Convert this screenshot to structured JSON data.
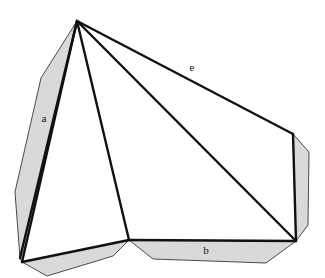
{
  "figure": {
    "title": "",
    "kind": "line-drawing",
    "canvas": {
      "width": 325,
      "height": 278,
      "background": "#ffffff"
    },
    "colors": {
      "stroke": "#111111",
      "shade_fill": "#d9d9d9",
      "shade_stroke": "#4a4a4a",
      "label_text": "#111111",
      "background": "#ffffff"
    },
    "stroke_widths": {
      "main_edge": 2.4,
      "thin_edge": 1.0
    },
    "vertices": {
      "apex": {
        "x": 77,
        "y": 21
      },
      "bottom_left": {
        "x": 22,
        "y": 262
      },
      "bottom_mid": {
        "x": 129,
        "y": 240
      },
      "bottom_right": {
        "x": 296,
        "y": 241
      },
      "top_right": {
        "x": 293,
        "y": 134
      },
      "left_shade_outer_top": {
        "x": 41,
        "y": 78
      },
      "left_shade_outer_bend": {
        "x": 15,
        "y": 192
      },
      "left_shade_outer_bottom": {
        "x": 20,
        "y": 258
      },
      "bottom_shade_left": {
        "x": 47,
        "y": 276
      },
      "bottom_shade_mid": {
        "x": 113,
        "y": 256
      },
      "bottom_shade_right_in": {
        "x": 153,
        "y": 259
      },
      "bottom_shade_right_out": {
        "x": 266,
        "y": 263
      },
      "right_shade_top": {
        "x": 309,
        "y": 152
      },
      "right_shade_bottom": {
        "x": 308,
        "y": 225
      }
    },
    "faces": [
      {
        "name": "left-shaded-face",
        "shaded": true
      },
      {
        "name": "bottom-shaded-face",
        "shaded": true
      },
      {
        "name": "right-shaded-face",
        "shaded": true
      }
    ],
    "edges": [
      {
        "name": "apex-to-left-shade",
        "from": "apex",
        "to": "left_shade_outer_bottom"
      },
      {
        "name": "apex-to-bottom-left",
        "from": "apex",
        "to": "bottom_left"
      },
      {
        "name": "apex-to-bottom-mid",
        "from": "apex",
        "to": "bottom_mid"
      },
      {
        "name": "apex-to-bottom-right",
        "from": "apex",
        "to": "bottom_right"
      },
      {
        "name": "apex-to-top-right",
        "from": "apex",
        "to": "top_right",
        "label": "e"
      },
      {
        "name": "bottom-left-to-bottom-mid",
        "from": "bottom_left",
        "to": "bottom_mid"
      },
      {
        "name": "bottom-mid-to-bottom-right",
        "from": "bottom_mid",
        "to": "bottom_right",
        "label": "b"
      },
      {
        "name": "top-right-to-bottom-right",
        "from": "top_right",
        "to": "bottom_right"
      }
    ],
    "labels": [
      {
        "id": "a",
        "text": "a",
        "x": 44,
        "y": 122,
        "edge": "apex-to-bottom-left"
      },
      {
        "id": "e",
        "text": "e",
        "x": 192,
        "y": 71,
        "edge": "apex-to-top-right"
      },
      {
        "id": "b",
        "text": "b",
        "x": 206,
        "y": 254,
        "edge": "bottom-mid-to-bottom-right"
      }
    ]
  }
}
